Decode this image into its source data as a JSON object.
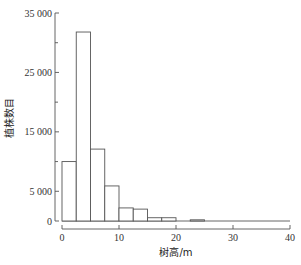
{
  "chart_data": {
    "type": "bar",
    "subtype": "histogram",
    "title": "",
    "xlabel": "树高/m",
    "ylabel": "植株数目",
    "bin_width": 2.5,
    "bins": [
      {
        "x0": 0,
        "x1": 2.5,
        "value": 10000
      },
      {
        "x0": 2.5,
        "x1": 5,
        "value": 31800
      },
      {
        "x0": 5,
        "x1": 7.5,
        "value": 12100
      },
      {
        "x0": 7.5,
        "x1": 10,
        "value": 5900
      },
      {
        "x0": 10,
        "x1": 12.5,
        "value": 2200
      },
      {
        "x0": 12.5,
        "x1": 15,
        "value": 2000
      },
      {
        "x0": 15,
        "x1": 17.5,
        "value": 550
      },
      {
        "x0": 17.5,
        "x1": 20,
        "value": 550
      },
      {
        "x0": 20,
        "x1": 22.5,
        "value": 0
      },
      {
        "x0": 22.5,
        "x1": 25,
        "value": 200
      }
    ],
    "categories": [
      "0-2.5",
      "2.5-5",
      "5-7.5",
      "7.5-10",
      "10-12.5",
      "12.5-15",
      "15-17.5",
      "17.5-20",
      "20-22.5",
      "22.5-25"
    ],
    "values": [
      10000,
      31800,
      12100,
      5900,
      2200,
      2000,
      550,
      550,
      0,
      200
    ],
    "xlim": [
      0,
      40
    ],
    "ylim": [
      0,
      35000
    ],
    "x_ticks": [
      0,
      10,
      20,
      30,
      40
    ],
    "x_tick_labels": [
      "0",
      "10",
      "20",
      "30",
      "40"
    ],
    "y_ticks_major": [
      0,
      5000,
      15000,
      25000,
      35000
    ],
    "y_tick_labels": [
      "0",
      "5 000",
      "15 000",
      "25 000",
      "35 000"
    ],
    "y_ticks_minor": [
      10000,
      20000,
      30000
    ],
    "grid": false,
    "legend": null
  }
}
